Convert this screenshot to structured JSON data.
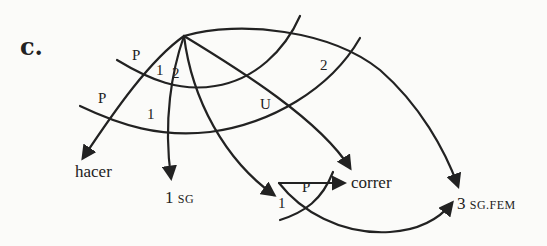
{
  "panel_label": "c.",
  "targets": {
    "hacer": "hacer",
    "first_sg_num": "1",
    "first_sg_feat": "SG",
    "correr": "correr",
    "third_num": "3",
    "third_feat": "SG.FEM"
  },
  "arc_labels": {
    "p_upper": "P",
    "one_upper": "1",
    "two_upper": "2",
    "p_lower": "P",
    "one_lower": "1",
    "u": "U",
    "two_right": "2",
    "p_small": "P",
    "one_small": "1"
  },
  "colors": {
    "ink": "#222222",
    "background": "#fbfbf9"
  }
}
